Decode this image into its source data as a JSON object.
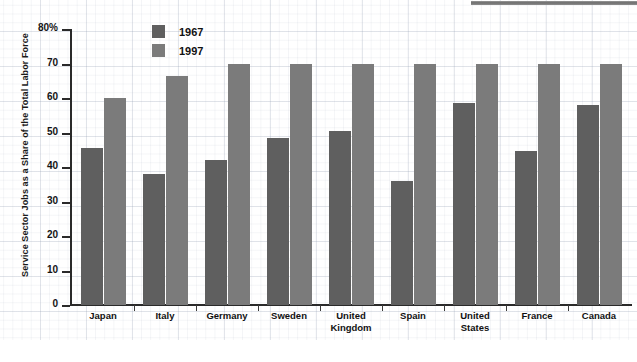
{
  "chart_data": {
    "type": "bar",
    "title": "",
    "xlabel": "",
    "ylabel": "Service Sector Jobs as a Share of the Total Labor Force",
    "ylim": [
      0,
      80
    ],
    "yticks": [
      0,
      10,
      20,
      30,
      40,
      50,
      60,
      70,
      80
    ],
    "ytick_labels": [
      "0",
      "10",
      "20",
      "30",
      "40",
      "50",
      "60",
      "70",
      "80%"
    ],
    "grid": true,
    "legend_position": "top-center",
    "categories": [
      "Japan",
      "Italy",
      "Germany",
      "Sweden",
      "United Kingdom",
      "Spain",
      "United States",
      "France",
      "Canada"
    ],
    "category_lines": [
      [
        "Japan"
      ],
      [
        "Italy"
      ],
      [
        "Germany"
      ],
      [
        "Sweden"
      ],
      [
        "United",
        "Kingdom"
      ],
      [
        "Spain"
      ],
      [
        "United",
        "States"
      ],
      [
        "France"
      ],
      [
        "Canada"
      ]
    ],
    "series": [
      {
        "name": "1967",
        "color": "#5f5f5f",
        "values": [
          45.5,
          38.0,
          42.0,
          48.5,
          50.5,
          36.0,
          58.5,
          44.5,
          58.0
        ]
      },
      {
        "name": "1997",
        "color": "#7b7b7b",
        "values": [
          60.0,
          66.5,
          70.0,
          70.0,
          70.0,
          70.0,
          70.0,
          70.0,
          70.0
        ]
      }
    ]
  },
  "legend": {
    "entries": [
      {
        "label": "1967"
      },
      {
        "label": "1997"
      }
    ]
  },
  "colors": {
    "series_1967": "#5f5f5f",
    "series_1997": "#7b7b7b",
    "axis": "#2a2a2a",
    "text": "#111111",
    "paper_grid": "#96a0b4"
  }
}
